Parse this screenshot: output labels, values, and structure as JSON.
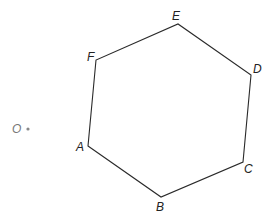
{
  "diagram": {
    "type": "hexagon-with-external-point",
    "stroke_color": "#2a2a2a",
    "point_color": "#888888",
    "vertices": [
      {
        "name": "A",
        "x": 88,
        "y": 146,
        "label_x": 76,
        "label_y": 141
      },
      {
        "name": "B",
        "x": 161,
        "y": 197,
        "label_x": 156,
        "label_y": 201
      },
      {
        "name": "C",
        "x": 243,
        "y": 162,
        "label_x": 244,
        "label_y": 163
      },
      {
        "name": "D",
        "x": 251,
        "y": 75,
        "label_x": 253,
        "label_y": 63
      },
      {
        "name": "E",
        "x": 178,
        "y": 24,
        "label_x": 172,
        "label_y": 10
      },
      {
        "name": "F",
        "x": 96,
        "y": 60,
        "label_x": 87,
        "label_y": 51
      }
    ],
    "external_point": {
      "name": "O",
      "x": 28,
      "y": 129,
      "label_x": 12,
      "label_y": 123
    }
  }
}
